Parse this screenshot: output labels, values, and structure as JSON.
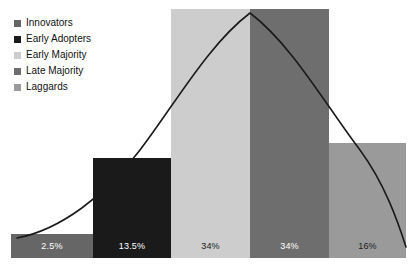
{
  "chart_data": {
    "type": "bar",
    "title": "",
    "subtitle": "",
    "xlabel": "",
    "ylabel": "",
    "grid": false,
    "legend_position": "top-left",
    "categories": [
      "Innovators",
      "Early Adopters",
      "Early Majority",
      "Late Majority",
      "Laggards"
    ],
    "values": [
      2.5,
      13.5,
      34,
      34,
      16
    ],
    "value_labels": [
      "2.5%",
      "13.5%",
      "34%",
      "34%",
      "16%"
    ],
    "ylim": [
      0,
      34
    ],
    "colors": [
      "#666666",
      "#1a1a1a",
      "#cdcdcd",
      "#6e6e6e",
      "#9a9a9a"
    ],
    "overlay": {
      "type": "line",
      "name": "bell-curve",
      "color": "#1a1a1a",
      "description": "normal distribution bell curve peaking over the Early Majority / Late Majority boundary"
    },
    "bars": [
      {
        "category": "Innovators",
        "value": 2.5,
        "label": "2.5%",
        "color": "#666666",
        "label_color": "#ffffff",
        "x": 11,
        "width": 82,
        "top": 234
      },
      {
        "category": "Early Adopters",
        "value": 13.5,
        "label": "13.5%",
        "color": "#1a1a1a",
        "label_color": "#ffffff",
        "x": 93,
        "width": 78,
        "top": 158
      },
      {
        "category": "Early Majority",
        "value": 34,
        "label": "34%",
        "color": "#cdcdcd",
        "label_color": "#1a1a1a",
        "x": 171,
        "width": 79,
        "top": 9
      },
      {
        "category": "Late Majority",
        "value": 34,
        "label": "34%",
        "color": "#6e6e6e",
        "label_color": "#ffffff",
        "x": 250,
        "width": 79,
        "top": 9
      },
      {
        "category": "Laggards",
        "value": 16,
        "label": "16%",
        "color": "#9a9a9a",
        "label_color": "#1a1a1a",
        "x": 329,
        "width": 77,
        "top": 143
      }
    ],
    "baseline_y": 258,
    "label_band_top": 234
  },
  "legend": {
    "items": [
      {
        "label": "Innovators",
        "color": "#666666"
      },
      {
        "label": "Early Adopters",
        "color": "#1a1a1a"
      },
      {
        "label": "Early Majority",
        "color": "#cdcdcd"
      },
      {
        "label": "Late Majority",
        "color": "#6e6e6e"
      },
      {
        "label": "Laggards",
        "color": "#9a9a9a"
      }
    ]
  }
}
